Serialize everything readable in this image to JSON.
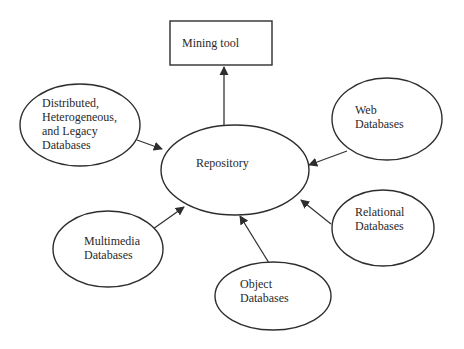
{
  "diagram": {
    "colors": {
      "stroke": "#2e2e2e",
      "text": "#2a2a2a",
      "background": "#ffffff"
    },
    "nodes": [
      {
        "id": "mining-tool",
        "shape": "rect",
        "x": 170,
        "y": 21,
        "w": 102,
        "h": 44,
        "lines": [
          "Mining tool"
        ],
        "text_x": 182,
        "text_y": 47
      },
      {
        "id": "repository",
        "shape": "ellipse",
        "cx": 235,
        "cy": 170,
        "rx": 74,
        "ry": 45,
        "lines": [
          "Repository"
        ],
        "text_x": 196,
        "text_y": 167
      },
      {
        "id": "distributed-databases",
        "shape": "ellipse",
        "cx": 80,
        "cy": 125,
        "rx": 60,
        "ry": 41,
        "lines": [
          "Distributed,",
          "Heterogeneous,",
          "and Legacy",
          "Databases"
        ],
        "text_x": 42,
        "text_y": 107
      },
      {
        "id": "web-databases",
        "shape": "ellipse",
        "cx": 387,
        "cy": 119,
        "rx": 55,
        "ry": 41,
        "lines": [
          "Web",
          "Databases"
        ],
        "text_x": 355,
        "text_y": 114
      },
      {
        "id": "relational-databases",
        "shape": "ellipse",
        "cx": 383,
        "cy": 228,
        "rx": 51,
        "ry": 38,
        "lines": [
          "Relational",
          "Databases"
        ],
        "text_x": 355,
        "text_y": 216
      },
      {
        "id": "object-databases",
        "shape": "ellipse",
        "cx": 273,
        "cy": 296,
        "rx": 58,
        "ry": 34,
        "lines": [
          "Object",
          "Databases"
        ],
        "text_x": 240,
        "text_y": 288
      },
      {
        "id": "multimedia-databases",
        "shape": "ellipse",
        "cx": 108,
        "cy": 249,
        "rx": 55,
        "ry": 38,
        "lines": [
          "Multimedia",
          "Databases"
        ],
        "text_x": 84,
        "text_y": 245
      }
    ],
    "edges": [
      {
        "from": "repository",
        "to": "mining-tool",
        "x1": 224,
        "y1": 125,
        "x2": 224,
        "y2": 67
      },
      {
        "from": "distributed-databases",
        "to": "repository",
        "x1": 137,
        "y1": 140,
        "x2": 162,
        "y2": 149
      },
      {
        "from": "web-databases",
        "to": "repository",
        "x1": 347,
        "y1": 151,
        "x2": 309,
        "y2": 165
      },
      {
        "from": "relational-databases",
        "to": "repository",
        "x1": 331,
        "y1": 224,
        "x2": 301,
        "y2": 200
      },
      {
        "from": "object-databases",
        "to": "repository",
        "x1": 269,
        "y1": 263,
        "x2": 240,
        "y2": 216
      },
      {
        "from": "multimedia-databases",
        "to": "repository",
        "x1": 153,
        "y1": 229,
        "x2": 184,
        "y2": 207
      }
    ]
  }
}
